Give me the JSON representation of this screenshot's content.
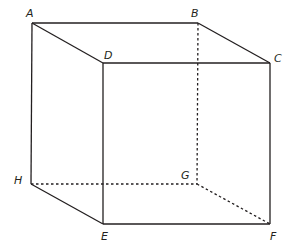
{
  "diagram": {
    "type": "cube",
    "vertices": {
      "A": {
        "label": "A",
        "x": 32,
        "y": 23
      },
      "B": {
        "label": "B",
        "x": 198,
        "y": 23
      },
      "C": {
        "label": "C",
        "x": 270,
        "y": 63
      },
      "D": {
        "label": "D",
        "x": 103,
        "y": 63
      },
      "E": {
        "label": "E",
        "x": 103,
        "y": 224
      },
      "F": {
        "label": "F",
        "x": 270,
        "y": 224
      },
      "G": {
        "label": "G",
        "x": 197,
        "y": 184
      },
      "H": {
        "label": "H",
        "x": 31,
        "y": 184
      }
    },
    "solid_edges": [
      "AB",
      "BC",
      "CD",
      "DA",
      "DE",
      "EF",
      "FC",
      "AH",
      "HE"
    ],
    "hidden_edges": [
      "BG",
      "GH",
      "GF"
    ],
    "line_color": "#231f20"
  }
}
